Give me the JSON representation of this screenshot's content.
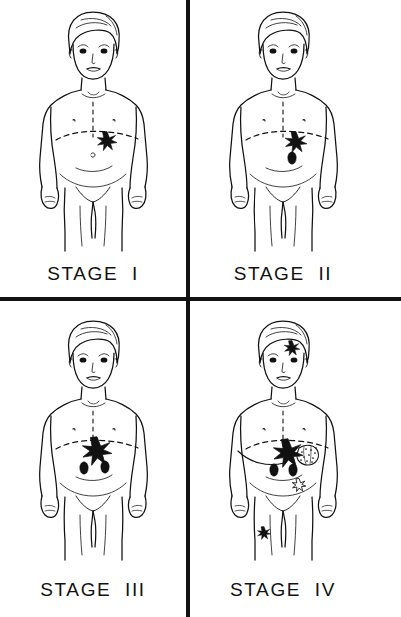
{
  "figure": {
    "type": "medical-illustration",
    "line_color": "#111111",
    "background_color": "#ffffff",
    "panel_count": 4,
    "divider_color": "#111111"
  },
  "panels": [
    {
      "id": "stage-1",
      "label": "STAGE  I",
      "subject": "child-front-view",
      "markers": {
        "primary_tumor": {
          "shape": "filled-star",
          "location": "left-upper-abdomen-at-diaphragm-line",
          "count": 1
        },
        "lymph_nodes": {
          "shape": "filled-oval",
          "count": 0
        },
        "distant_lesions": {
          "count": 0
        },
        "adjacent_mass": {
          "present": false
        }
      }
    },
    {
      "id": "stage-2",
      "label": "STAGE  II",
      "subject": "child-front-view",
      "markers": {
        "primary_tumor": {
          "shape": "filled-star",
          "location": "left-upper-abdomen-at-diaphragm-line",
          "count": 1
        },
        "lymph_nodes": {
          "shape": "filled-oval",
          "count": 1
        },
        "distant_lesions": {
          "count": 0
        },
        "adjacent_mass": {
          "present": false
        }
      }
    },
    {
      "id": "stage-3",
      "label": "STAGE  III",
      "subject": "child-front-view",
      "markers": {
        "primary_tumor": {
          "shape": "filled-star",
          "location": "mid-upper-abdomen-at-diaphragm-line",
          "count": 1,
          "size": "large"
        },
        "lymph_nodes": {
          "shape": "filled-oval",
          "count": 2
        },
        "distant_lesions": {
          "count": 0
        },
        "adjacent_mass": {
          "present": false
        }
      }
    },
    {
      "id": "stage-4",
      "label": "STAGE  IV",
      "subject": "child-front-view",
      "markers": {
        "primary_tumor": {
          "shape": "filled-star",
          "location": "mid-upper-abdomen-at-diaphragm-line",
          "count": 1,
          "size": "large"
        },
        "lymph_nodes": {
          "shape": "filled-oval",
          "count": 2
        },
        "distant_lesions": {
          "count": 3,
          "locations": [
            "forehead-temple",
            "lower-left-abdomen",
            "left-thigh"
          ]
        },
        "adjacent_mass": {
          "present": true,
          "shape": "stippled-lobulated-mass",
          "location": "left-flank-beside-primary"
        }
      }
    }
  ],
  "anatomy": {
    "midline": "vertical-dashed",
    "diaphragm": "horizontal-dashed-arc",
    "features": [
      "head",
      "torso",
      "arms",
      "hands",
      "legs",
      "navel",
      "nipples"
    ]
  }
}
